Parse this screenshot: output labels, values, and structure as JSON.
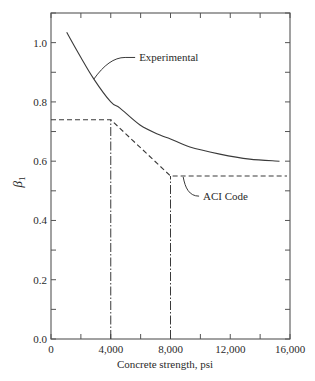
{
  "chart_data": {
    "type": "line",
    "title": "",
    "xlabel": "Concrete strength, psi",
    "ylabel": {
      "symbol": "β",
      "subscript": "1"
    },
    "xlim": [
      0,
      16000
    ],
    "ylim": [
      0,
      1.1
    ],
    "grid": false,
    "legend": "none (inline annotations)",
    "x_ticks": {
      "major_step": 2000,
      "labeled": [
        0,
        4000,
        8000,
        12000,
        16000
      ],
      "labels": [
        "0",
        "4,000",
        "8,000",
        "12,000",
        "16,000"
      ]
    },
    "y_ticks": {
      "major_step": 0.1,
      "labeled": [
        0.0,
        0.2,
        0.4,
        0.6,
        0.8,
        1.0
      ],
      "labels": [
        "0.0",
        "0.2",
        "0.4",
        "0.6",
        "0.8",
        "1.0"
      ]
    },
    "series": [
      {
        "name": "Experimental",
        "style": "solid",
        "x": [
          1050,
          2000,
          2870,
          4000,
          4620,
          5960,
          7300,
          8000,
          9300,
          11300,
          13300,
          15300
        ],
        "y": [
          1.035,
          0.95,
          0.877,
          0.8,
          0.779,
          0.722,
          0.688,
          0.675,
          0.648,
          0.624,
          0.607,
          0.6
        ]
      },
      {
        "name": "ACI Code",
        "style": "dashed",
        "x": [
          0,
          4000,
          8000,
          15800
        ],
        "y": [
          0.74,
          0.74,
          0.55,
          0.55
        ]
      }
    ],
    "reference_lines": [
      {
        "style": "dash-dot",
        "orientation": "vertical",
        "x": 4000,
        "y_from": 0,
        "y_to": 0.74
      },
      {
        "style": "dash-dot",
        "orientation": "vertical",
        "x": 8000,
        "y_from": 0,
        "y_to": 0.55
      }
    ],
    "annotations": [
      {
        "text": "Experimental",
        "x": 5900,
        "y": 0.95,
        "points_to": [
          2870,
          0.877
        ]
      },
      {
        "text": "ACI Code",
        "x": 10180,
        "y": 0.482,
        "points_to": [
          8850,
          0.55
        ]
      }
    ]
  },
  "colors": {
    "axis": "#555555",
    "line": "#3a3a3a",
    "text": "#2a2a2a",
    "background": "#ffffff"
  }
}
